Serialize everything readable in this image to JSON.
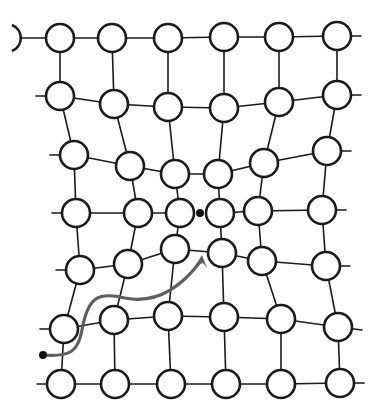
{
  "diagram": {
    "title": "",
    "colors": {
      "background": "#ffffff",
      "bond": "#1a1a1a",
      "atom_fill": "#ffffff",
      "atom_stroke": "#1a1a1a",
      "path": "#5f5f5f",
      "dot": "#111111"
    },
    "atom_radius": 14,
    "rows": [
      [
        [
          60,
          38
        ],
        [
          112,
          38
        ],
        [
          168,
          38
        ],
        [
          224,
          37
        ],
        [
          279,
          37
        ],
        [
          337,
          36
        ]
      ],
      [
        [
          60,
          96
        ],
        [
          114,
          104
        ],
        [
          168,
          107
        ],
        [
          224,
          108
        ],
        [
          279,
          102
        ],
        [
          337,
          95
        ]
      ],
      [
        [
          74,
          155
        ],
        [
          130,
          166
        ],
        [
          175,
          174
        ],
        [
          218,
          174
        ],
        [
          264,
          163
        ],
        [
          327,
          151
        ]
      ],
      [
        [
          76,
          213
        ],
        [
          138,
          213
        ],
        [
          180,
          213
        ],
        [
          220,
          213
        ],
        [
          258,
          211
        ],
        [
          322,
          210
        ]
      ],
      [
        [
          80,
          270
        ],
        [
          128,
          264
        ],
        [
          175,
          249
        ],
        [
          222,
          253
        ],
        [
          262,
          261
        ],
        [
          326,
          266
        ]
      ],
      [
        [
          64,
          329
        ],
        [
          114,
          320
        ],
        [
          168,
          316
        ],
        [
          224,
          317
        ],
        [
          281,
          319
        ],
        [
          338,
          327
        ]
      ],
      [
        [
          61,
          384
        ],
        [
          115,
          384
        ],
        [
          171,
          384
        ],
        [
          226,
          384
        ],
        [
          281,
          384
        ],
        [
          340,
          383
        ]
      ]
    ],
    "partial_atom": {
      "x": 22,
      "y": 38
    },
    "dislocation_dot": {
      "x": 200,
      "y": 213,
      "r": 4
    },
    "path_start_dot": {
      "x": 43,
      "y": 355,
      "r": 4
    },
    "path_d": "M43,355 C70,357 78,352 82,330 C88,295 100,292 125,298 C150,303 175,295 200,262",
    "arrow_tip": {
      "x": 202,
      "y": 255
    }
  }
}
